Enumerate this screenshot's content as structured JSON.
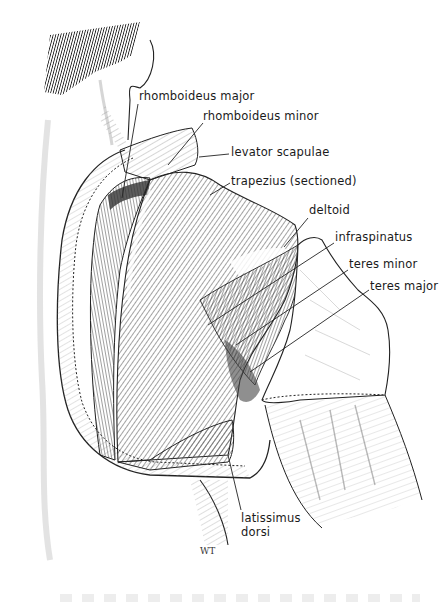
{
  "figure": {
    "signature": "WT",
    "colors": {
      "ink": "#1a1a1a",
      "shading": "#555555",
      "background": "#ffffff",
      "hair": "#111111"
    }
  },
  "labels": [
    {
      "id": "rhomboideus-major",
      "text": "rhomboideus major",
      "x": 139,
      "y": 90,
      "pointer": {
        "x1": 138,
        "y1": 104,
        "x2": 122,
        "y2": 198
      }
    },
    {
      "id": "rhomboideus-minor",
      "text": "rhomboideus minor",
      "x": 203,
      "y": 110,
      "pointer": {
        "x1": 203,
        "y1": 123,
        "x2": 168,
        "y2": 165
      }
    },
    {
      "id": "levator-scapulae",
      "text": "levator scapulae",
      "x": 231,
      "y": 146,
      "pointer": {
        "x1": 229,
        "y1": 154,
        "x2": 199,
        "y2": 157
      }
    },
    {
      "id": "trapezius-sectioned",
      "text": "trapezius (sectioned)",
      "x": 231,
      "y": 175,
      "pointer": {
        "x1": 230,
        "y1": 183,
        "x2": 210,
        "y2": 195
      }
    },
    {
      "id": "deltoid",
      "text": "deltoid",
      "x": 309,
      "y": 204,
      "pointer": {
        "x1": 308,
        "y1": 218,
        "x2": 284,
        "y2": 247
      }
    },
    {
      "id": "infraspinatus",
      "text": "infraspinatus",
      "x": 335,
      "y": 231,
      "pointer": {
        "x1": 334,
        "y1": 243,
        "x2": 208,
        "y2": 325
      }
    },
    {
      "id": "teres-minor",
      "text": "teres minor",
      "x": 349,
      "y": 258,
      "pointer": {
        "x1": 348,
        "y1": 270,
        "x2": 236,
        "y2": 345
      }
    },
    {
      "id": "teres-major",
      "text": "teres major",
      "x": 370,
      "y": 280,
      "pointer": {
        "x1": 369,
        "y1": 290,
        "x2": 250,
        "y2": 372
      }
    },
    {
      "id": "latissimus-dorsi",
      "text": "latissimus\ndorsi",
      "line1": "latissimus",
      "line2": "dorsi",
      "x": 241,
      "y": 512,
      "pointer": {
        "x1": 241,
        "y1": 510,
        "x2": 228,
        "y2": 455
      }
    }
  ]
}
